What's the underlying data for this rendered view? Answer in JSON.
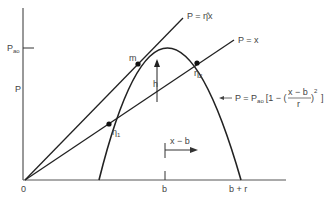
{
  "diagram": {
    "axes": {
      "y_label": "P",
      "y_tick_label": "P",
      "y_tick_sub": "ao",
      "origin_label": "0",
      "x_tick_b": "b",
      "x_tick_br": "b + r"
    },
    "lines": {
      "upper_label": "P = η̂x",
      "lower_label": "P = x"
    },
    "curve": {
      "formula_prefix": "P = P",
      "formula_sub": "ao",
      "formula_open": "[1 − (",
      "formula_num": "x − b",
      "formula_den": "r",
      "formula_close": ")",
      "formula_exp": "2",
      "formula_end": "]"
    },
    "points": {
      "m": "m",
      "eta1": "η",
      "eta1_sub": "1",
      "eta2": "η",
      "eta2_sub": "2"
    },
    "annotations": {
      "h": "h",
      "x_minus_b": "x − b"
    },
    "colors": {
      "ink": "#222222",
      "text": "#444444",
      "background": "#ffffff"
    }
  }
}
